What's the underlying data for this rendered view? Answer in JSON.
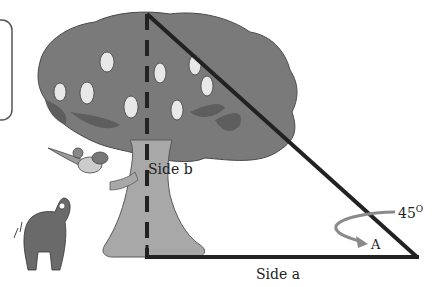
{
  "labels": {
    "side_b": "Side b",
    "side_a": "Side a",
    "angle_value": "45",
    "angle_unit": "O",
    "angle_name": "A"
  },
  "colors": {
    "foliage": "#7a7a7a",
    "foliage_dark": "#5e5e5e",
    "trunk": "#a8a8a8",
    "triangle": "#222222",
    "arrow": "#8a8a8a",
    "pear": "#e8e8e8"
  }
}
